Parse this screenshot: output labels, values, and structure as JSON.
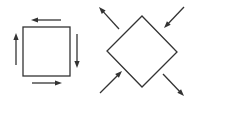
{
  "diagram": {
    "stroke_color": "#333333",
    "background": "#ffffff",
    "left_figure": {
      "shape": "square",
      "square": {
        "x": 23,
        "y": 27,
        "w": 47,
        "h": 49
      },
      "arrows": [
        {
          "name": "top",
          "x1": 61,
          "y1": 20,
          "x2": 31,
          "y2": 20,
          "direction": "left"
        },
        {
          "name": "right",
          "x1": 77,
          "y1": 34,
          "x2": 77,
          "y2": 68,
          "direction": "down"
        },
        {
          "name": "bottom",
          "x1": 32,
          "y1": 83,
          "x2": 62,
          "y2": 83,
          "direction": "right"
        },
        {
          "name": "left",
          "x1": 16,
          "y1": 65,
          "x2": 16,
          "y2": 33,
          "direction": "up"
        }
      ]
    },
    "right_figure": {
      "shape": "diamond",
      "points": {
        "top": [
          142,
          16
        ],
        "right": [
          177,
          52
        ],
        "bottom": [
          142,
          87
        ],
        "left": [
          107,
          51
        ]
      },
      "arrows": [
        {
          "name": "upper-left",
          "x1": 119,
          "y1": 29,
          "x2": 99,
          "y2": 7,
          "direction": "outward"
        },
        {
          "name": "upper-right",
          "x1": 184,
          "y1": 7,
          "x2": 164,
          "y2": 28,
          "direction": "inward"
        },
        {
          "name": "lower-left",
          "x1": 100,
          "y1": 93,
          "x2": 122,
          "y2": 71,
          "direction": "inward"
        },
        {
          "name": "lower-right",
          "x1": 163,
          "y1": 74,
          "x2": 184,
          "y2": 96,
          "direction": "outward"
        }
      ]
    }
  }
}
